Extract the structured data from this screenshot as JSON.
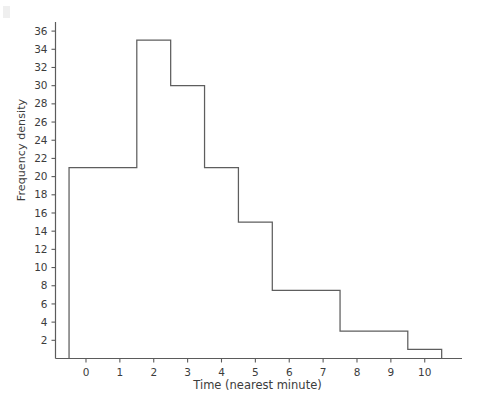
{
  "chart_data": {
    "type": "bar",
    "title": "",
    "subtitle": "",
    "xlabel": "Time (nearest minute)",
    "ylabel": "Frequency density",
    "xlim": [
      -0.9,
      11.1
    ],
    "ylim": [
      0,
      37
    ],
    "grid": false,
    "legend": null,
    "bin_edges": [
      -0.5,
      1.5,
      2.5,
      3.5,
      4.5,
      5.5,
      7.5,
      9.5,
      10.5
    ],
    "values": [
      21,
      35,
      30,
      21,
      15,
      7.5,
      3,
      1
    ],
    "bins": [
      {
        "from": -0.5,
        "to": 1.5,
        "frequency_density": 21
      },
      {
        "from": 1.5,
        "to": 2.5,
        "frequency_density": 35
      },
      {
        "from": 2.5,
        "to": 3.5,
        "frequency_density": 30
      },
      {
        "from": 3.5,
        "to": 4.5,
        "frequency_density": 21
      },
      {
        "from": 4.5,
        "to": 5.5,
        "frequency_density": 15
      },
      {
        "from": 5.5,
        "to": 7.5,
        "frequency_density": 7.5
      },
      {
        "from": 7.5,
        "to": 9.5,
        "frequency_density": 3
      },
      {
        "from": 9.5,
        "to": 10.5,
        "frequency_density": 1
      }
    ],
    "y_ticks": [
      2,
      4,
      6,
      8,
      10,
      12,
      14,
      16,
      18,
      20,
      22,
      24,
      26,
      28,
      30,
      32,
      34,
      36
    ],
    "y_tick_labels": [
      "2",
      "4",
      "6",
      "8",
      "10",
      "12",
      "14",
      "16",
      "18",
      "20",
      "22",
      "24",
      "26",
      "28",
      "30",
      "32",
      "34",
      "36"
    ],
    "x_ticks": [
      0,
      1,
      2,
      3,
      4,
      5,
      6,
      7,
      8,
      9,
      10
    ],
    "x_tick_labels": [
      "0",
      "1",
      "2",
      "3",
      "4",
      "5",
      "6",
      "7",
      "8",
      "9",
      "10"
    ],
    "bar_fill": "#ffffff",
    "bar_stroke": "#5e5e5e",
    "axis_color": "#5b5b5b",
    "text_color": "#3c3c3c",
    "background": "#ffffff"
  }
}
